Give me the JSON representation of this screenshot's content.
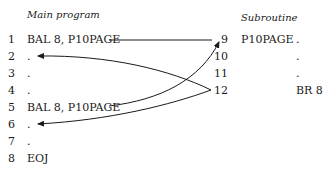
{
  "main": {
    "title": "Main program",
    "lines": [
      {
        "num": "1",
        "text": "BAL 8, P10PAGE"
      },
      {
        "num": "2",
        "text": "."
      },
      {
        "num": "3",
        "text": "."
      },
      {
        "num": "4",
        "text": "."
      },
      {
        "num": "5",
        "text": "BAL 8, P10PAGE"
      },
      {
        "num": "6",
        "text": "."
      },
      {
        "num": "7",
        "text": "."
      },
      {
        "num": "8",
        "text": "EOJ"
      }
    ]
  },
  "sub": {
    "title": "Subroutine",
    "lines": [
      {
        "num": "9",
        "label": "P10PAGE",
        "op": "."
      },
      {
        "num": "10",
        "label": "",
        "op": "."
      },
      {
        "num": "11",
        "label": "",
        "op": "."
      },
      {
        "num": "12",
        "label": "",
        "op": "BR 8"
      }
    ]
  }
}
